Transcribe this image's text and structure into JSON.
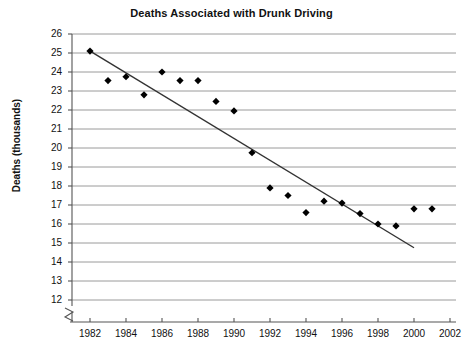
{
  "chart_data": {
    "type": "scatter",
    "title": "Deaths Associated with Drunk Driving",
    "xlabel": "",
    "ylabel": "Deaths (thousands)",
    "xlim": [
      1981,
      2002
    ],
    "ylim": [
      12,
      26
    ],
    "y_axis_break": true,
    "grid": true,
    "legend": "none",
    "x_ticks": [
      1982,
      1984,
      1986,
      1988,
      1990,
      1992,
      1994,
      1996,
      1998,
      2000,
      2002
    ],
    "y_ticks": [
      12,
      13,
      14,
      15,
      16,
      17,
      18,
      19,
      20,
      21,
      22,
      23,
      24,
      25,
      26
    ],
    "x": [
      1982,
      1983,
      1984,
      1985,
      1986,
      1987,
      1988,
      1989,
      1990,
      1991,
      1992,
      1993,
      1994,
      1995,
      1996,
      1997,
      1998,
      1999,
      2000,
      2001
    ],
    "values": [
      25.1,
      23.55,
      23.75,
      22.8,
      24.0,
      23.55,
      23.55,
      22.45,
      21.95,
      19.75,
      17.9,
      17.5,
      16.6,
      17.2,
      17.1,
      16.55,
      16.0,
      15.9,
      16.8,
      16.8
    ],
    "series": [
      {
        "name": "Deaths (thousands)",
        "values": [
          25.1,
          23.55,
          23.75,
          22.8,
          24.0,
          23.55,
          23.55,
          22.45,
          21.95,
          19.75,
          17.9,
          17.5,
          16.6,
          17.2,
          17.1,
          16.55,
          16.0,
          15.9,
          16.8,
          16.8
        ]
      }
    ],
    "trendline": {
      "x": [
        1982.1,
        2000.0
      ],
      "y": [
        25.05,
        14.75
      ]
    },
    "marker_color": "#000000",
    "trendline_color": "#333333",
    "grid_color": "#808080",
    "axis_color": "#555555"
  }
}
